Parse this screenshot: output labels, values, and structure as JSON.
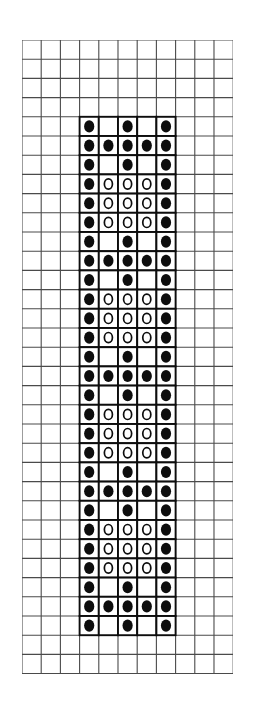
{
  "page": {
    "background_color": "#ffffff",
    "width": 253,
    "height": 720
  },
  "grid": {
    "label": "graph-paper-grid",
    "origin_x": 22,
    "origin_y": 40,
    "cell_size": 19.2,
    "columns": 11,
    "rows": 33,
    "line_color": "#4a4a4a",
    "line_width": 1.1,
    "grid_on": true
  },
  "legend": {
    "symbols": [
      {
        "key": "filled",
        "name": "filled-dot-symbol",
        "glyph": "●",
        "color": "#0d0d0d",
        "meaning": "knit / dark stitch"
      },
      {
        "key": "open",
        "name": "open-circle-symbol",
        "glyph": "○",
        "color": "#0d0d0d",
        "meaning": "purl / light stitch"
      },
      {
        "key": "blank",
        "name": "blank-cell-symbol",
        "glyph": "",
        "color": "#ffffff",
        "meaning": "empty stitch"
      }
    ]
  },
  "chart_data": {
    "type": "heatmap",
    "xlabel": "",
    "ylabel": "",
    "legend_position": "none",
    "grid": true,
    "symbol_values": {
      "filled": 2,
      "open": 1,
      "blank": 0
    },
    "pattern_origin": {
      "col": 3,
      "row": 4
    },
    "pattern_columns": 5,
    "pattern_rows": 27,
    "cell_box_color": "#0d0d0d",
    "cell_box_width": 1.9,
    "rows": [
      [
        "filled",
        "blank",
        "filled",
        "blank",
        "filled"
      ],
      [
        "filled",
        "filled",
        "filled",
        "filled",
        "filled"
      ],
      [
        "filled",
        "blank",
        "filled",
        "blank",
        "filled"
      ],
      [
        "filled",
        "open",
        "open",
        "open",
        "filled"
      ],
      [
        "filled",
        "open",
        "open",
        "open",
        "filled"
      ],
      [
        "filled",
        "open",
        "open",
        "open",
        "filled"
      ],
      [
        "filled",
        "blank",
        "filled",
        "blank",
        "filled"
      ],
      [
        "filled",
        "filled",
        "filled",
        "filled",
        "filled"
      ],
      [
        "filled",
        "blank",
        "filled",
        "blank",
        "filled"
      ],
      [
        "filled",
        "open",
        "open",
        "open",
        "filled"
      ],
      [
        "filled",
        "open",
        "open",
        "open",
        "filled"
      ],
      [
        "filled",
        "open",
        "open",
        "open",
        "filled"
      ],
      [
        "filled",
        "blank",
        "filled",
        "blank",
        "filled"
      ],
      [
        "filled",
        "filled",
        "filled",
        "filled",
        "filled"
      ],
      [
        "filled",
        "blank",
        "filled",
        "blank",
        "filled"
      ],
      [
        "filled",
        "open",
        "open",
        "open",
        "filled"
      ],
      [
        "filled",
        "open",
        "open",
        "open",
        "filled"
      ],
      [
        "filled",
        "open",
        "open",
        "open",
        "filled"
      ],
      [
        "filled",
        "blank",
        "filled",
        "blank",
        "filled"
      ],
      [
        "filled",
        "filled",
        "filled",
        "filled",
        "filled"
      ],
      [
        "filled",
        "blank",
        "filled",
        "blank",
        "filled"
      ],
      [
        "filled",
        "open",
        "open",
        "open",
        "filled"
      ],
      [
        "filled",
        "open",
        "open",
        "open",
        "filled"
      ],
      [
        "filled",
        "open",
        "open",
        "open",
        "filled"
      ],
      [
        "filled",
        "blank",
        "filled",
        "blank",
        "filled"
      ],
      [
        "filled",
        "filled",
        "filled",
        "filled",
        "filled"
      ],
      [
        "filled",
        "blank",
        "filled",
        "blank",
        "filled"
      ]
    ]
  }
}
